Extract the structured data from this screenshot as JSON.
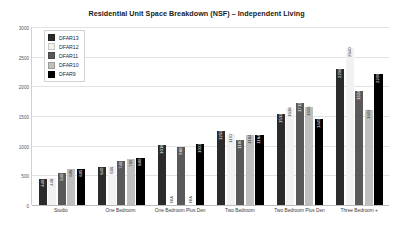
{
  "chart_data": {
    "type": "bar",
    "title": "Residential Unit Space Breakdown (NSF) – Independent Living",
    "xlabel": "",
    "ylabel": "",
    "ylim": [
      0,
      3000
    ],
    "ytick_step": 500,
    "yticks": [
      "0",
      "500",
      "1000",
      "1500",
      "2000",
      "2500",
      "3000"
    ],
    "grid": true,
    "legend_position": "upper-left-inside",
    "na_text": "N/A",
    "categories": [
      "Studio",
      "One Bedroom",
      "One Bedroom Plus Den",
      "Two Bedroom",
      "Two Bedroom Plus Den",
      "Three Bedroom +"
    ],
    "series": [
      {
        "name": "DFAR13",
        "color": "#2b2b2b",
        "values": [
          440,
          640,
          1018,
          1252,
          1533,
          2298
        ],
        "labels": [
          "440",
          "640",
          "1018",
          "1252",
          "1533",
          "2298"
        ]
      },
      {
        "name": "DFAR12",
        "color": "#f2f2f2",
        "values": [
          448,
          656,
          null,
          1192,
          1638,
          2640
        ],
        "labels": [
          "448",
          "656",
          "N/A",
          "1192",
          "1638",
          "2640"
        ]
      },
      {
        "name": "DFAR11",
        "color": "#595959",
        "values": [
          540,
          740,
          980,
          1100,
          1712,
          1924
        ],
        "labels": [
          "540",
          "740",
          "980",
          "1100",
          "1712",
          "1924"
        ]
      },
      {
        "name": "DFAR10",
        "color": "#bfbfbf",
        "values": [
          606,
          769,
          null,
          1184,
          1655,
          1602
        ],
        "labels": [
          "606",
          "769",
          "N/A",
          "1184",
          "1655",
          "1602"
        ]
      },
      {
        "name": "DFAR9",
        "color": "#000000",
        "values": [
          605,
          800,
          1022,
          1184,
          1445,
          2209
        ],
        "labels": [
          "605",
          "800",
          "1022",
          "1184",
          "1445",
          "2209"
        ]
      }
    ]
  }
}
